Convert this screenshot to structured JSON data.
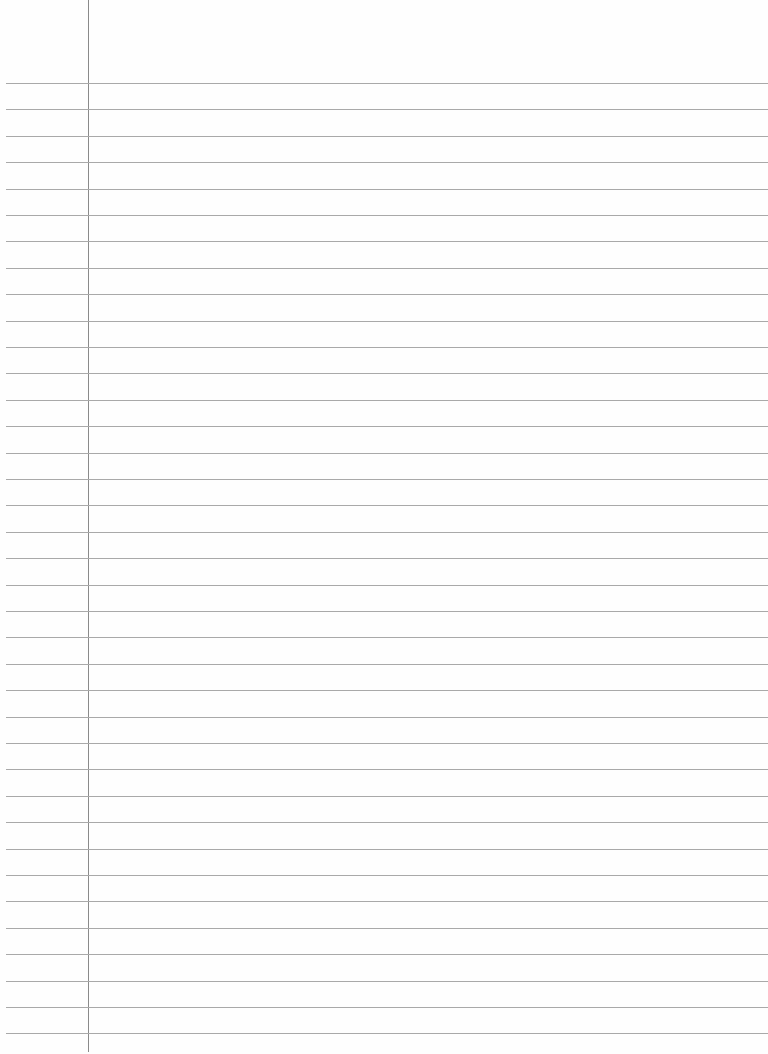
{
  "paper": {
    "type": "lined-paper",
    "line_count": 37,
    "first_line_y": 83,
    "line_spacing": 26.4,
    "margin_x": 88,
    "colors": {
      "background": "#fefefe",
      "rule": "#a9a9a9",
      "margin": "#8a8a8a"
    }
  }
}
